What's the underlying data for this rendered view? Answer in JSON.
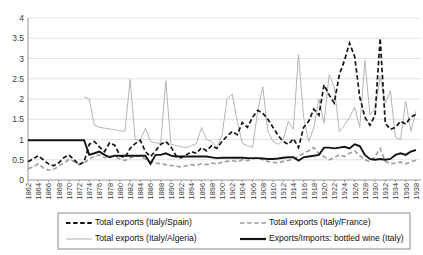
{
  "chart_data": {
    "type": "line",
    "title": "",
    "xlabel": "",
    "ylabel": "",
    "ylim": [
      0,
      4
    ],
    "xlim": [
      1862,
      1939
    ],
    "grid": true,
    "legend_position": "bottom",
    "ytick_labels": [
      "0",
      "0.5",
      "1",
      "1.5",
      "2",
      "2.5",
      "3",
      "3.5",
      "4"
    ],
    "ytick_values": [
      0,
      0.5,
      1,
      1.5,
      2,
      2.5,
      3,
      3.5,
      4
    ],
    "xtick_labels": [
      "1862",
      "1864",
      "1866",
      "1868",
      "1870",
      "1872",
      "1874",
      "1876",
      "1878",
      "1880",
      "1882",
      "1884",
      "1886",
      "1888",
      "1890",
      "1892",
      "1894",
      "1896",
      "1898",
      "1900",
      "1902",
      "1904",
      "1906",
      "1908",
      "1910",
      "1912",
      "1914",
      "1916",
      "1918",
      "1920",
      "1922",
      "1924",
      "1926",
      "1928",
      "1930",
      "1932",
      "1934",
      "1936",
      "1938"
    ],
    "x": [
      1862,
      1863,
      1864,
      1865,
      1866,
      1867,
      1868,
      1869,
      1870,
      1871,
      1872,
      1873,
      1874,
      1875,
      1876,
      1877,
      1878,
      1879,
      1880,
      1881,
      1882,
      1883,
      1884,
      1885,
      1886,
      1887,
      1888,
      1889,
      1890,
      1891,
      1892,
      1893,
      1894,
      1895,
      1896,
      1897,
      1898,
      1899,
      1900,
      1901,
      1902,
      1903,
      1904,
      1905,
      1906,
      1907,
      1908,
      1909,
      1910,
      1911,
      1912,
      1913,
      1914,
      1915,
      1916,
      1917,
      1918,
      1919,
      1920,
      1921,
      1922,
      1923,
      1924,
      1925,
      1926,
      1927,
      1928,
      1929,
      1930,
      1931,
      1932,
      1933,
      1934,
      1935,
      1936,
      1937,
      1938
    ],
    "series": [
      {
        "name": "Total exports (Italy/Spain)",
        "style": "dashed",
        "color": "#141414",
        "width": "bold",
        "values": [
          0.45,
          0.52,
          0.6,
          0.5,
          0.4,
          0.35,
          0.42,
          0.55,
          0.62,
          0.5,
          0.38,
          0.45,
          0.88,
          0.95,
          0.82,
          0.7,
          0.92,
          0.86,
          0.6,
          0.55,
          0.78,
          0.9,
          0.98,
          0.7,
          0.58,
          0.72,
          0.88,
          0.95,
          0.82,
          0.6,
          0.55,
          0.62,
          0.7,
          0.66,
          0.8,
          0.72,
          0.85,
          0.78,
          0.95,
          1.08,
          1.2,
          1.12,
          1.42,
          1.3,
          1.55,
          1.72,
          1.65,
          1.5,
          1.3,
          1.1,
          0.95,
          0.88,
          1.02,
          0.8,
          1.3,
          1.45,
          1.75,
          1.6,
          2.35,
          2.1,
          1.9,
          2.6,
          2.95,
          3.38,
          3.05,
          2.05,
          1.55,
          1.35,
          1.6,
          3.5,
          1.4,
          1.25,
          1.3,
          1.45,
          1.38,
          1.55,
          1.62
        ]
      },
      {
        "name": "Total exports (Italy/France)",
        "style": "dashed",
        "color": "#9d9d9d",
        "width": "medium",
        "values": [
          0.28,
          0.32,
          0.4,
          0.3,
          0.24,
          0.26,
          0.34,
          0.42,
          0.5,
          0.46,
          0.38,
          0.42,
          0.52,
          0.58,
          0.62,
          0.55,
          0.6,
          0.58,
          0.52,
          0.48,
          0.55,
          0.58,
          0.6,
          0.52,
          0.45,
          0.42,
          0.4,
          0.38,
          0.36,
          0.34,
          0.32,
          0.35,
          0.38,
          0.36,
          0.4,
          0.38,
          0.42,
          0.4,
          0.44,
          0.46,
          0.48,
          0.45,
          0.5,
          0.48,
          0.52,
          0.55,
          0.5,
          0.46,
          0.44,
          0.42,
          0.46,
          0.48,
          0.52,
          0.58,
          0.66,
          0.72,
          0.8,
          0.65,
          0.58,
          0.5,
          0.55,
          0.62,
          0.58,
          0.66,
          0.72,
          0.6,
          0.5,
          0.45,
          0.58,
          0.78,
          0.46,
          0.4,
          0.42,
          0.44,
          0.4,
          0.45,
          0.48
        ]
      },
      {
        "name": "Total exports (Italy/Algeria)",
        "style": "solid",
        "color": "#b0b0b0",
        "width": "thin",
        "values": [
          null,
          null,
          null,
          null,
          null,
          null,
          null,
          null,
          null,
          null,
          null,
          2.05,
          2.0,
          1.35,
          1.3,
          1.28,
          1.26,
          1.24,
          1.22,
          1.2,
          2.48,
          1.0,
          0.98,
          1.28,
          0.95,
          0.92,
          0.9,
          2.45,
          0.88,
          0.85,
          0.82,
          0.8,
          0.85,
          0.9,
          1.3,
          1.0,
          0.95,
          0.8,
          1.1,
          2.0,
          2.12,
          1.45,
          0.9,
          0.85,
          0.8,
          1.7,
          2.3,
          1.2,
          0.95,
          0.88,
          1.0,
          1.45,
          1.25,
          3.1,
          1.55,
          0.95,
          1.3,
          2.0,
          1.4,
          2.6,
          2.3,
          1.2,
          1.35,
          1.55,
          1.8,
          1.3,
          2.95,
          1.6,
          1.75,
          2.55,
          1.9,
          2.2,
          1.05,
          1.0,
          1.95,
          1.2,
          1.7
        ]
      },
      {
        "name": "Exports/Imports: bottled wine (Italy)",
        "style": "solid",
        "color": "#141414",
        "width": "bold",
        "values": [
          0.98,
          0.98,
          0.98,
          0.98,
          0.98,
          0.98,
          0.98,
          0.98,
          0.98,
          0.98,
          0.98,
          0.98,
          0.62,
          0.66,
          0.7,
          0.62,
          0.56,
          0.6,
          0.6,
          0.6,
          0.6,
          0.6,
          0.6,
          0.6,
          0.4,
          0.62,
          0.62,
          0.66,
          0.6,
          0.58,
          0.58,
          0.58,
          0.58,
          0.58,
          0.58,
          0.58,
          0.56,
          0.54,
          0.55,
          0.55,
          0.55,
          0.55,
          0.55,
          0.54,
          0.54,
          0.54,
          0.53,
          0.52,
          0.52,
          0.53,
          0.55,
          0.56,
          0.56,
          0.48,
          0.56,
          0.58,
          0.6,
          0.62,
          0.8,
          0.8,
          0.78,
          0.8,
          0.82,
          0.78,
          0.88,
          0.84,
          0.62,
          0.52,
          0.5,
          0.52,
          0.5,
          0.52,
          0.62,
          0.66,
          0.62,
          0.7,
          0.74
        ]
      }
    ]
  },
  "legend": {
    "entries": [
      {
        "label": "Total exports (Italy/Spain)",
        "marker": "dashed-bold-black"
      },
      {
        "label": "Total exports (Italy/France)",
        "marker": "dashed-gray"
      },
      {
        "label": "Total exports (Italy/Algeria)",
        "marker": "solid-thin-gray"
      },
      {
        "label": "Exports/Imports: bottled wine (Italy)",
        "marker": "solid-bold-black"
      }
    ]
  },
  "colors": {
    "spain": "#141414",
    "france": "#9d9d9d",
    "algeria": "#b0b0b0",
    "bottled": "#141414",
    "grid": "#d4d4d4",
    "axis": "#8a8a8a"
  }
}
